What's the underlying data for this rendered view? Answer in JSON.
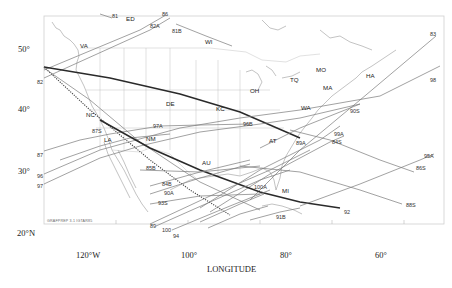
{
  "map": {
    "credit": "GRAFPREP 3.1 IGTAR85",
    "x_axis": {
      "title": "LONGITUDE",
      "ticks": [
        "120°W",
        "100°",
        "80°",
        "60°"
      ]
    },
    "y_axis": {
      "ticks": [
        "50°",
        "40°",
        "30°",
        "20°N"
      ]
    },
    "station_labels": [
      "VA",
      "ED",
      "WI",
      "TQ",
      "MO",
      "OH",
      "HA",
      "MA",
      "WA",
      "NC",
      "DE",
      "KC",
      "LA",
      "NM",
      "AT",
      "AU",
      "MI"
    ],
    "track_labels": [
      "81",
      "86",
      "82A",
      "81B",
      "83",
      "98",
      "82",
      "87S",
      "87",
      "96",
      "97",
      "97A",
      "90S",
      "96B",
      "89A",
      "84S",
      "99A",
      "95A",
      "86S",
      "88S",
      "85B",
      "84B",
      "90A",
      "93S",
      "100A",
      "89",
      "100",
      "94",
      "92",
      "91B"
    ]
  }
}
